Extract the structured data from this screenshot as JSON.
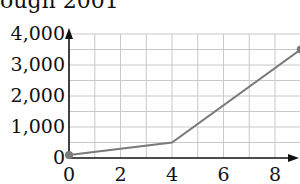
{
  "title": "ough 2001",
  "chart_data": {
    "type": "line",
    "xlabel": "",
    "ylabel": "",
    "x": [
      0,
      4,
      9
    ],
    "series": [
      {
        "name": "series",
        "values": [
          100,
          500,
          3500
        ]
      }
    ],
    "xlim": [
      0,
      9
    ],
    "ylim": [
      0,
      4000
    ],
    "xticks": [
      "0",
      "2",
      "4",
      "6",
      "8"
    ],
    "yticks": [
      "0",
      "1,000",
      "2,000",
      "3,000",
      "4,000"
    ],
    "grid": true,
    "legend": null,
    "colors": {
      "line": "#7a7a7a",
      "grid": "#c8c8c8",
      "axis": "#111111"
    }
  }
}
